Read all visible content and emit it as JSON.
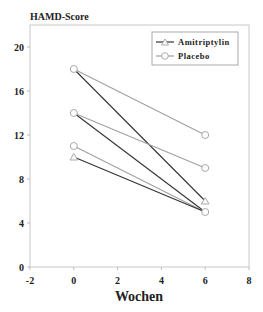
{
  "chart_data": {
    "type": "line",
    "title": "HAMD-Score",
    "xlabel": "Wochen",
    "ylabel": "HAMD-Score",
    "xlim": [
      -2,
      8
    ],
    "ylim": [
      0,
      22
    ],
    "x_ticks": [
      "-2",
      "0",
      "2",
      "4",
      "6",
      "8"
    ],
    "y_ticks": [
      "0",
      "4",
      "8",
      "12",
      "16",
      "20"
    ],
    "grid": false,
    "legend_position": "upper right",
    "legend": [
      {
        "label": "Amitriptylin",
        "marker": "triangle",
        "color": "#333333"
      },
      {
        "label": "Placebo",
        "marker": "circle",
        "color": "#999999"
      }
    ],
    "series": [
      {
        "name": "Placebo",
        "group": "Placebo",
        "x": [
          0,
          6
        ],
        "values": [
          18,
          12
        ]
      },
      {
        "name": "Amitriptylin",
        "group": "Amitriptylin",
        "x": [
          0,
          6
        ],
        "values": [
          18,
          6
        ]
      },
      {
        "name": "Placebo",
        "group": "Placebo",
        "x": [
          0,
          6
        ],
        "values": [
          14,
          9
        ]
      },
      {
        "name": "Amitriptylin",
        "group": "Amitriptylin",
        "x": [
          0,
          6
        ],
        "values": [
          14,
          5
        ]
      },
      {
        "name": "Placebo",
        "group": "Placebo",
        "x": [
          0,
          6
        ],
        "values": [
          11,
          5
        ]
      },
      {
        "name": "Amitriptylin",
        "group": "Amitriptylin",
        "x": [
          0,
          6
        ],
        "values": [
          10,
          5
        ]
      }
    ],
    "markers": [
      {
        "x": 0,
        "y": 18,
        "shape": "circle"
      },
      {
        "x": 0,
        "y": 14,
        "shape": "circle"
      },
      {
        "x": 0,
        "y": 11,
        "shape": "circle"
      },
      {
        "x": 0,
        "y": 10,
        "shape": "triangle"
      },
      {
        "x": 6,
        "y": 12,
        "shape": "circle"
      },
      {
        "x": 6,
        "y": 9,
        "shape": "circle"
      },
      {
        "x": 6,
        "y": 6,
        "shape": "triangle"
      },
      {
        "x": 6,
        "y": 5,
        "shape": "circle"
      }
    ]
  },
  "colors": {
    "amitriptylin": "#333333",
    "placebo": "#a0a0a0",
    "marker": "#a8a8a8",
    "axis": "#bbbbbb"
  }
}
